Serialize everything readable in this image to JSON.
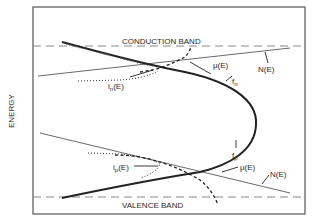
{
  "diagram": {
    "axis_label": "ENERGY",
    "bands": {
      "conduction": "CONDUCTION BAND",
      "valence": "VALENCE BAND"
    },
    "labels": {
      "mu_upper": "μ(E)",
      "N_upper": "N(E)",
      "f_n": "f",
      "f_n_sub": "n",
      "i_n": "i",
      "i_n_sub": "n",
      "i_n_arg": "(E)",
      "mu_lower": "μ(E)",
      "N_lower": "N(E)",
      "f_p": "f",
      "f_p_sub": "p",
      "i_p": "i",
      "i_p_sub": "p",
      "i_p_arg": "(E)"
    },
    "colors": {
      "line": "#222222",
      "dash": "#777777",
      "frame": "#555555"
    }
  }
}
